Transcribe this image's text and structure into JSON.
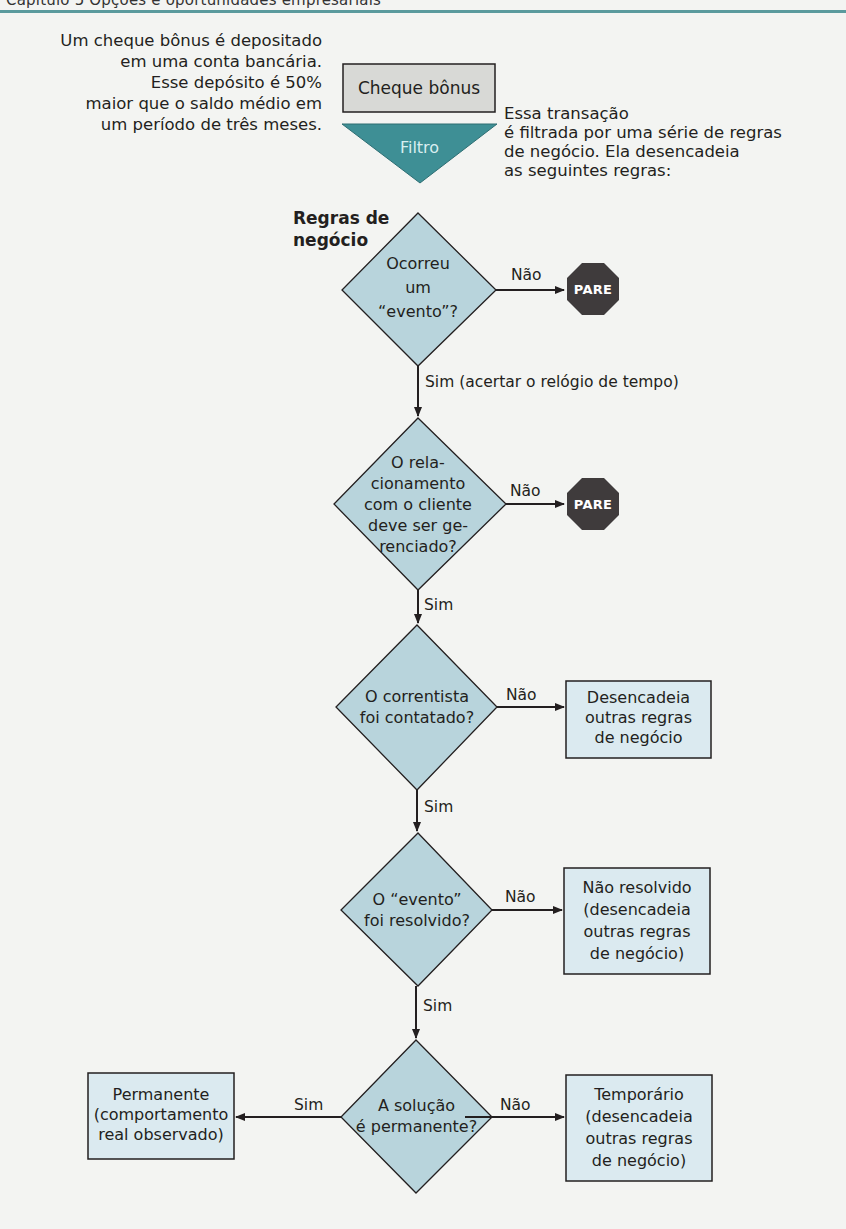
{
  "header": {
    "title_cropped": "Capítulo 5  Opções e oportunidades empresariais"
  },
  "colors": {
    "header_rule": "#5a9a9d",
    "filter_fill": "#3e8f95",
    "start_box_fill": "#d8d9d6",
    "decision_fill": "#b8d4dc",
    "outcome_box_fill": "#dbeaf0",
    "stop_fill": "#3f3b3c",
    "line": "#231f20"
  },
  "intro": {
    "left_text": "Um cheque bônus é depositado\nem uma conta bancária.\nEsse depósito é 50%\nmaior que o saldo médio em\num período de três meses.",
    "right_text": "Essa transação\né filtrada por uma série de regras\nde negócio. Ela desencadeia\nas seguintes regras:"
  },
  "nodes": {
    "start": {
      "label": "Cheque bônus"
    },
    "filter": {
      "label": "Filtro"
    },
    "rules_heading": {
      "label": "Regras de\nnegócio"
    },
    "decision1": {
      "label": "Ocorreu\num\n“evento”?"
    },
    "decision2": {
      "label": "O rela-\ncionamento\ncom o cliente\ndeve ser ge-\nrenciado?"
    },
    "decision3": {
      "label": "O correntista\nfoi contatado?"
    },
    "decision4": {
      "label": "O “evento”\nfoi resolvido?"
    },
    "decision5": {
      "label": "A solução\né permanente?"
    },
    "stop1": {
      "label": "PARE"
    },
    "stop2": {
      "label": "PARE"
    },
    "outcome3": {
      "label": "Desencadeia\noutras regras\nde negócio"
    },
    "outcome4": {
      "label": "Não resolvido\n(desencadeia\noutras regras\nde negócio)"
    },
    "outcome5_yes": {
      "label": "Permanente\n(comportamento\nreal observado)"
    },
    "outcome5_no": {
      "label": "Temporário\n(desencadeia\noutras regras\nde negócio)"
    }
  },
  "edges": {
    "d1_no": "Não",
    "d1_yes": "Sim (acertar o relógio de tempo)",
    "d2_no": "Não",
    "d2_yes": "Sim",
    "d3_no": "Não",
    "d3_yes": "Sim",
    "d4_no": "Não",
    "d4_yes": "Sim",
    "d5_yes": "Sim",
    "d5_no": "Não"
  }
}
